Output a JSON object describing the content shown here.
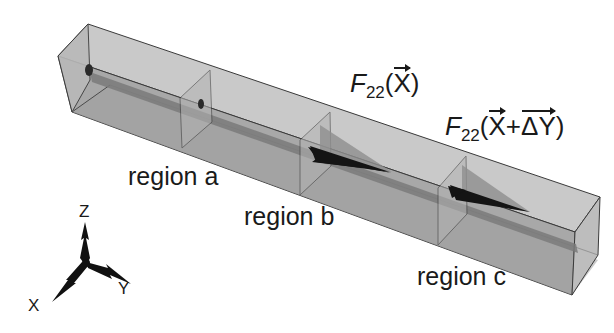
{
  "figure": {
    "labels": {
      "force_1": {
        "fn": "F",
        "sub": "22",
        "open": "(",
        "var": "X",
        "close": ")"
      },
      "force_2": {
        "fn": "F",
        "sub": "22",
        "open": "(",
        "var1": "X",
        "plus": "+",
        "var2": "ΔY",
        "close": ")"
      },
      "regions": [
        {
          "id": "a",
          "text": "region a"
        },
        {
          "id": "b",
          "text": "region b"
        },
        {
          "id": "c",
          "text": "region c"
        }
      ]
    },
    "axes": {
      "z": "Z",
      "x": "X",
      "y": "Y"
    },
    "colors": {
      "box_top": "#c4c4c4",
      "box_front": "#a9a9a9",
      "box_end": "#bcbcbc",
      "edge": "#3a3a3a",
      "rod": "#7a7a7a",
      "arrow_dark": "#141414",
      "arrow_light": "#8e8e8e",
      "background": "#ffffff"
    }
  }
}
